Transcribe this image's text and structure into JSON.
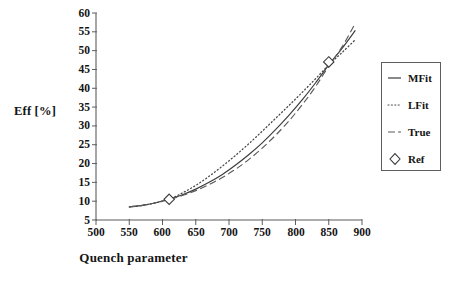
{
  "chart_data": {
    "type": "line",
    "title": "",
    "xlabel": "Quench parameter",
    "ylabel": "Eff [%]",
    "xlim": [
      500,
      900
    ],
    "ylim": [
      5,
      60
    ],
    "xticks": [
      500,
      550,
      600,
      650,
      700,
      750,
      800,
      850,
      900
    ],
    "yticks": [
      5,
      10,
      15,
      20,
      25,
      30,
      35,
      40,
      45,
      50,
      55,
      60
    ],
    "grid": false,
    "legend_position": "right",
    "series": [
      {
        "name": "MFit",
        "style": "solid",
        "color": "#3a3a3a",
        "x": [
          550,
          570,
          590,
          610,
          630,
          650,
          670,
          690,
          710,
          730,
          750,
          770,
          790,
          810,
          830,
          850,
          870,
          890
        ],
        "y": [
          8.5,
          8.9,
          9.6,
          10.5,
          11.7,
          13.2,
          15.0,
          17.1,
          19.6,
          22.4,
          25.5,
          29.0,
          32.8,
          36.9,
          41.4,
          46.2,
          50.6,
          55.4
        ]
      },
      {
        "name": "LFit",
        "style": "dotted",
        "color": "#4a4a4a",
        "x": [
          550,
          570,
          590,
          610,
          630,
          650,
          670,
          690,
          710,
          730,
          750,
          770,
          790,
          810,
          830,
          850,
          870,
          890
        ],
        "y": [
          8.5,
          8.9,
          9.6,
          10.5,
          12.2,
          14.2,
          16.6,
          19.3,
          22.2,
          25.3,
          28.6,
          32.0,
          35.4,
          38.9,
          42.5,
          46.2,
          49.5,
          52.9
        ]
      },
      {
        "name": "True",
        "style": "dashed",
        "color": "#5a5a5a",
        "x": [
          550,
          570,
          590,
          610,
          630,
          650,
          670,
          690,
          710,
          730,
          750,
          770,
          790,
          810,
          830,
          850,
          870,
          890
        ],
        "y": [
          8.5,
          8.9,
          9.6,
          10.5,
          11.5,
          12.8,
          14.4,
          16.3,
          18.5,
          21.1,
          24.1,
          27.5,
          31.3,
          35.6,
          40.4,
          45.9,
          51.0,
          57.3
        ]
      }
    ],
    "markers": [
      {
        "name": "Ref",
        "x": 610,
        "y": 10.5
      },
      {
        "name": "Ref",
        "x": 850,
        "y": 47.0
      }
    ],
    "legend": [
      {
        "label": "MFit",
        "style": "solid"
      },
      {
        "label": "LFit",
        "style": "dotted"
      },
      {
        "label": "True",
        "style": "dashed"
      },
      {
        "label": "Ref",
        "style": "marker-diamond"
      }
    ]
  },
  "axes": {
    "y_label": "Eff [%]",
    "x_label": "Quench parameter",
    "y_tick_labels": [
      "60",
      "55",
      "50",
      "45",
      "40",
      "35",
      "30",
      "25",
      "20",
      "15",
      "10",
      "5"
    ],
    "x_tick_labels": [
      "500",
      "550",
      "600",
      "650",
      "700",
      "750",
      "800",
      "850",
      "900"
    ]
  },
  "legend": {
    "items": [
      {
        "label": "MFit"
      },
      {
        "label": "LFit"
      },
      {
        "label": "True"
      },
      {
        "label": "Ref"
      }
    ]
  },
  "colors": {
    "axis": "#5d5d5d",
    "mfit": "#3a3a3a",
    "lfit": "#4a4a4a",
    "true": "#5a5a5a",
    "text": "#141414",
    "background": "#ffffff"
  }
}
